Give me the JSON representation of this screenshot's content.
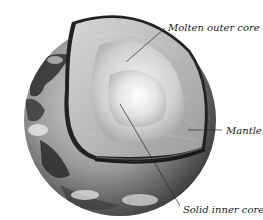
{
  "figure": {
    "labels": {
      "outer_core": "Molten outer core",
      "mantle": "Mantle",
      "inner_core": "Solid inner core"
    }
  },
  "colors": {
    "background": "#ffffff",
    "label_text": "#1a1a1a",
    "leader_line": "#2a2a2a",
    "crust_rim": "#1e1e1e",
    "ocean_dark": "#3a3a3a",
    "cloud_light": "#e6e6e6"
  }
}
